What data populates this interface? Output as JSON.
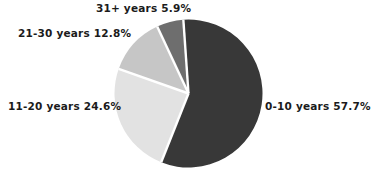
{
  "chart_data": {
    "type": "pie",
    "title": "",
    "subtitle": "",
    "xlabel": "",
    "ylabel": "",
    "grid": false,
    "legend_position": "outside-labels",
    "categories": [
      "0-10 years",
      "11-20 years",
      "21-30 years",
      "31+ years"
    ],
    "values": [
      57.7,
      24.6,
      12.8,
      5.9
    ],
    "units": "%",
    "slice_colors": [
      "#383838",
      "#e2e2e2",
      "#c6c6c6",
      "#6e6e6e"
    ],
    "separator_color": "#ffffff",
    "start_angle_deg": -4,
    "direction": "clockwise",
    "labels": [
      {
        "id": "slice-0-10",
        "category": "0-10 years",
        "value": 57.7,
        "text": "0-10 years  57.7%",
        "color": "#383838"
      },
      {
        "id": "slice-11-20",
        "category": "11-20 years",
        "value": 24.6,
        "text": "11-20 years 24.6%",
        "color": "#e2e2e2"
      },
      {
        "id": "slice-21-30",
        "category": "21-30 years",
        "value": 12.8,
        "text": "21-30 years  12.8%",
        "color": "#c6c6c6"
      },
      {
        "id": "slice-31plus",
        "category": "31+ years",
        "value": 5.9,
        "text": "31+ years  5.9%",
        "color": "#6e6e6e"
      }
    ]
  },
  "chart": {
    "label_0_10": "0-10 years  57.7%",
    "label_11_20": "11-20 years 24.6%",
    "label_21_30": "21-30 years  12.8%",
    "label_31_plus": "31+ years  5.9%"
  },
  "colors": {
    "background": "#ffffff",
    "text": "#1b1b1b",
    "slice_dark": "#383838",
    "slice_light": "#e2e2e2",
    "slice_medium": "#c6c6c6",
    "slice_mid_dark": "#6e6e6e",
    "separator": "#ffffff"
  }
}
